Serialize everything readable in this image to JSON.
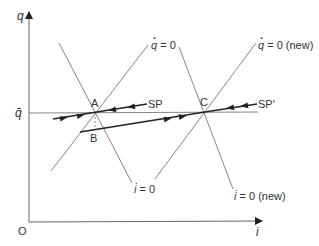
{
  "axes": {
    "y_label": "q",
    "x_label": "i",
    "origin_label": "O",
    "qbar_label": "q̄"
  },
  "curves": {
    "qdot_zero": {
      "sym": "q",
      "eq": " = 0"
    },
    "qdot_zero_new": {
      "sym": "q",
      "eq": " = 0 (new)"
    },
    "idot_zero": {
      "sym": "i̇",
      "eq": " = 0"
    },
    "idot_zero_new": {
      "sym": "i̇",
      "eq": " = 0 (new)"
    }
  },
  "points": {
    "A": "A",
    "B": "B",
    "C": "C"
  },
  "paths": {
    "saddle_path": "SP",
    "saddle_path_new": "SP′"
  },
  "colors": {
    "thin_line": "#777777",
    "thick_line": "#222222",
    "text": "#333333"
  }
}
